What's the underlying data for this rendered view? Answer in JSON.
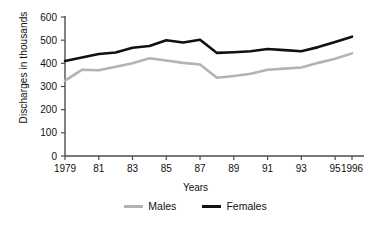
{
  "chart_data": {
    "type": "line",
    "title": "",
    "xlabel": "Years",
    "ylabel": "Discharges in thousands",
    "x": [
      1979,
      1980,
      1981,
      1982,
      1983,
      1984,
      1985,
      1986,
      1987,
      1988,
      1989,
      1990,
      1991,
      1992,
      1993,
      1994,
      1995,
      1996
    ],
    "xtick_labels": [
      "1979",
      "81",
      "83",
      "85",
      "87",
      "89",
      "91",
      "93",
      "95",
      "1996"
    ],
    "xtick_values": [
      1979,
      1981,
      1983,
      1985,
      1987,
      1989,
      1991,
      1993,
      1995,
      1996
    ],
    "ytick_labels": [
      "0",
      "100",
      "200",
      "300",
      "400",
      "500",
      "600"
    ],
    "ytick_values": [
      0,
      100,
      200,
      300,
      400,
      500,
      600
    ],
    "ylim": [
      0,
      600
    ],
    "xlim": [
      1979,
      1996
    ],
    "grid": false,
    "legend_position": "bottom",
    "series": [
      {
        "name": "Males",
        "color": "#b3b3b3",
        "values": [
          325,
          372,
          370,
          385,
          400,
          422,
          412,
          402,
          395,
          338,
          345,
          355,
          372,
          377,
          382,
          402,
          420,
          443
        ]
      },
      {
        "name": "Females",
        "color": "#111111",
        "values": [
          410,
          425,
          440,
          447,
          467,
          475,
          500,
          490,
          502,
          445,
          448,
          452,
          462,
          457,
          452,
          470,
          492,
          515
        ]
      }
    ]
  },
  "legend": {
    "males_label": "Males",
    "females_label": "Females"
  },
  "axes": {
    "x_title": "Years",
    "y_title": "Discharges in thousands"
  }
}
